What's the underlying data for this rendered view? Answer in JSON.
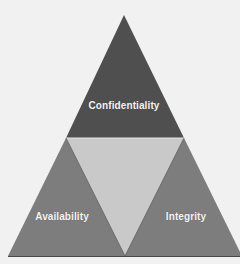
{
  "diagram": {
    "type": "triangle",
    "nodes": [
      {
        "id": "confidentiality",
        "label": "Confidentiality",
        "position": "top",
        "color": "#4f4f4f"
      },
      {
        "id": "availability",
        "label": "Availability",
        "position": "bottom-left",
        "color": "#7d7d7d"
      },
      {
        "id": "integrity",
        "label": "Integrity",
        "position": "bottom-right",
        "color": "#7d7d7d"
      }
    ],
    "center": {
      "color": "#c9c9c9"
    },
    "background_color": "#f1f1f1"
  }
}
